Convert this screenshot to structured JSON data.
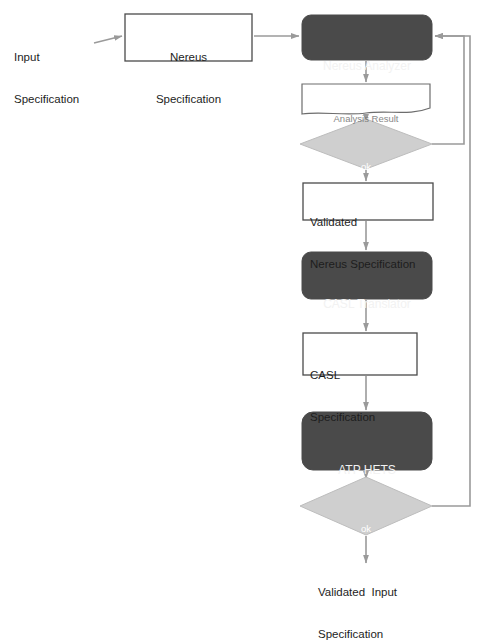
{
  "diagram": {
    "type": "flowchart",
    "background_color": "#ffffff",
    "palette": {
      "process_fill": "#4a4a4a",
      "process_text": "#f2f2f2",
      "decision_fill": "#cfcfcf",
      "decision_stroke": "#b4b4b4",
      "decision_text": "#ffffff",
      "data_fill": "#ffffff",
      "data_stroke": "#4b4b4b",
      "connector": "#9a9a9a",
      "text": "#1d1d1d"
    },
    "nodes": [
      {
        "id": "input-specification",
        "shape": "text",
        "lines": [
          "Input",
          "Specification"
        ],
        "x": 14,
        "y": 22,
        "width": 90,
        "height": 32
      },
      {
        "id": "nereus-specification",
        "shape": "rectangle",
        "lines": [
          "Nereus",
          "Specification"
        ],
        "x": 125,
        "y": 14,
        "width": 127,
        "height": 47
      },
      {
        "id": "nereus-analyzer",
        "shape": "rounded-process",
        "lines": [
          "Nereus Analyzer"
        ],
        "x": 302,
        "y": 15,
        "width": 130,
        "height": 45
      },
      {
        "id": "analysis-result",
        "shape": "document",
        "lines": [
          "Analysis Result"
        ],
        "x": 302,
        "y": 84,
        "width": 128,
        "height": 28
      },
      {
        "id": "decision-analysis-ok",
        "shape": "diamond",
        "lines": [
          "ok"
        ],
        "x": 300,
        "y": 119,
        "width": 132,
        "height": 50
      },
      {
        "id": "validated-nereus-specification",
        "shape": "rectangle",
        "lines": [
          "Validated",
          "Nereus Specification"
        ],
        "x": 303,
        "y": 183,
        "width": 130,
        "height": 37
      },
      {
        "id": "casl-translator",
        "shape": "rounded-process",
        "lines": [
          "CASL Translator"
        ],
        "x": 302,
        "y": 252,
        "width": 130,
        "height": 47
      },
      {
        "id": "casl-specification",
        "shape": "rectangle",
        "lines": [
          "CASL",
          "Specification"
        ],
        "x": 303,
        "y": 333,
        "width": 114,
        "height": 42
      },
      {
        "id": "atp-hets",
        "shape": "rounded-process",
        "lines": [
          "ATP HETS"
        ],
        "x": 302,
        "y": 412,
        "width": 130,
        "height": 58
      },
      {
        "id": "decision-proof-ok",
        "shape": "diamond",
        "lines": [
          "ok"
        ],
        "x": 300,
        "y": 477,
        "width": 132,
        "height": 58
      },
      {
        "id": "validated-input-specification",
        "shape": "text",
        "lines": [
          "Validated  Input",
          "Specification"
        ],
        "x": 318,
        "y": 557,
        "width": 130,
        "height": 32
      }
    ],
    "edges": [
      {
        "id": "edge-input-to-nereus-spec",
        "from": "input-specification",
        "to": "nereus-specification",
        "label": ""
      },
      {
        "id": "edge-nereus-spec-to-analyzer",
        "from": "nereus-specification",
        "to": "nereus-analyzer",
        "label": ""
      },
      {
        "id": "edge-analyzer-to-result",
        "from": "nereus-analyzer",
        "to": "analysis-result",
        "label": ""
      },
      {
        "id": "edge-result-to-decision-ok",
        "from": "analysis-result",
        "to": "decision-analysis-ok",
        "label": ""
      },
      {
        "id": "edge-decision-ok-to-validated-spec",
        "from": "decision-analysis-ok",
        "to": "validated-nereus-specification",
        "label": ""
      },
      {
        "id": "edge-decision-ok-feedback-analyzer",
        "from": "decision-analysis-ok",
        "to": "nereus-analyzer",
        "label": ""
      },
      {
        "id": "edge-validated-spec-to-translator",
        "from": "validated-nereus-specification",
        "to": "casl-translator",
        "label": ""
      },
      {
        "id": "edge-translator-to-casl-spec",
        "from": "casl-translator",
        "to": "casl-specification",
        "label": ""
      },
      {
        "id": "edge-casl-spec-to-atp",
        "from": "casl-specification",
        "to": "atp-hets",
        "label": ""
      },
      {
        "id": "edge-atp-to-decision-proof",
        "from": "atp-hets",
        "to": "decision-proof-ok",
        "label": ""
      },
      {
        "id": "edge-decision-proof-to-output",
        "from": "decision-proof-ok",
        "to": "validated-input-specification",
        "label": ""
      },
      {
        "id": "edge-decision-proof-feedback-analyzer",
        "from": "decision-proof-ok",
        "to": "nereus-analyzer",
        "label": ""
      }
    ]
  }
}
